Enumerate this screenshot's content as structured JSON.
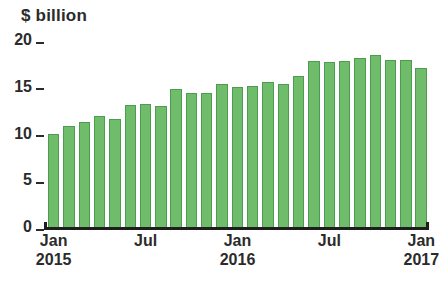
{
  "chart_data": {
    "type": "bar",
    "title": "$ billion",
    "subtitle": "",
    "xlabel": "",
    "ylabel": "$ billion",
    "ylim": [
      0,
      20
    ],
    "yticks": [
      "0",
      "5",
      "10",
      "15",
      "20"
    ],
    "ytick_values": [
      0,
      5,
      10,
      15,
      20
    ],
    "grid": false,
    "legend": null,
    "bar_color": "#6fbc6b",
    "bar_edge_color": "#4e9c51",
    "axis_color": "#1e1e1e",
    "text_color": "#2b2b2b",
    "categories": [
      "Jan 2015",
      "Feb 2015",
      "Mar 2015",
      "Apr 2015",
      "May 2015",
      "Jun 2015",
      "Jul 2015",
      "Aug 2015",
      "Sep 2015",
      "Oct 2015",
      "Nov 2015",
      "Dec 2015",
      "Jan 2016",
      "Feb 2016",
      "Mar 2016",
      "Apr 2016",
      "May 2016",
      "Jun 2016",
      "Jul 2016",
      "Aug 2016",
      "Sep 2016",
      "Oct 2016",
      "Nov 2016",
      "Dec 2016",
      "Jan 2017"
    ],
    "values": [
      10.0,
      10.8,
      11.2,
      11.9,
      11.5,
      13.0,
      13.2,
      12.9,
      14.8,
      14.3,
      14.3,
      15.3,
      15.0,
      15.1,
      15.5,
      15.3,
      16.1,
      17.8,
      17.7,
      17.8,
      18.1,
      18.4,
      17.9,
      17.9,
      17.0
    ],
    "xtick_labels": [
      {
        "month": "Jan",
        "year": "2015",
        "index": 0
      },
      {
        "month": "Jul",
        "year": "",
        "index": 6
      },
      {
        "month": "Jan",
        "year": "2016",
        "index": 12
      },
      {
        "month": "Jul",
        "year": "",
        "index": 18
      },
      {
        "month": "Jan",
        "year": "2017",
        "index": 24
      }
    ]
  }
}
